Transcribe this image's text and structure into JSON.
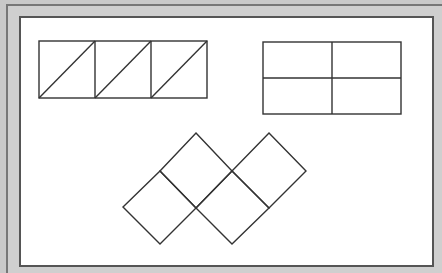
{
  "diagram": {
    "colors": {
      "stroke": "#333333",
      "background": "#ffffff",
      "frame": "#cfcfcf"
    },
    "shapes": [
      {
        "id": "rectangle-divided-by-diagonals",
        "description": "Rectangle split into 3 squares, each with a diagonal",
        "x": 39,
        "y": 41,
        "width": 168,
        "height": 57,
        "columns": 3,
        "diagonals": 3
      },
      {
        "id": "rectangle-quartered",
        "description": "Rectangle split into 4 equal parts (2x2)",
        "x": 263,
        "y": 42,
        "width": 138,
        "height": 72,
        "rows": 2,
        "columns": 2
      },
      {
        "id": "tilted-squares-composite",
        "description": "Composite of 5 squares rotated 45 degrees",
        "squares": 5
      }
    ]
  }
}
